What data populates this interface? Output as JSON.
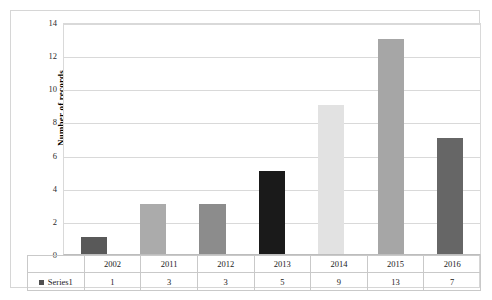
{
  "chart_data": {
    "type": "bar",
    "title": "",
    "xlabel": "",
    "ylabel": "Number of records",
    "categories": [
      "2002",
      "2011",
      "2012",
      "2013",
      "2014",
      "2015",
      "2016"
    ],
    "values": [
      1,
      3,
      3,
      5,
      9,
      13,
      7
    ],
    "series": [
      {
        "name": "Series1",
        "values": [
          1,
          3,
          3,
          5,
          9,
          13,
          7
        ]
      }
    ],
    "ylim": [
      0,
      14
    ],
    "y_ticks": [
      0,
      2,
      4,
      6,
      8,
      10,
      12,
      14
    ],
    "y_tick_labels": [
      "0",
      "2",
      "4",
      "6",
      "8",
      "10",
      "12",
      "14"
    ],
    "grid": true,
    "legend_position": "data-table",
    "bar_colors": [
      "#595959",
      "#ababab",
      "#8c8c8c",
      "#1a1a1a",
      "#e2e2e2",
      "#a6a6a6",
      "#666666"
    ],
    "data_table": {
      "legend_label": "Series1",
      "legend_swatch_color": "#4f4f4f",
      "header_row": [
        "2002",
        "2011",
        "2012",
        "2013",
        "2014",
        "2015",
        "2016"
      ],
      "value_row": [
        "1",
        "3",
        "3",
        "5",
        "9",
        "13",
        "7"
      ]
    }
  },
  "colors": {
    "background": "#ffffff",
    "frame_border": "#d6d6d6",
    "gridline": "#d9d9d9",
    "axis_text": "#2b2b2b",
    "table_border": "#c9c9c9"
  }
}
